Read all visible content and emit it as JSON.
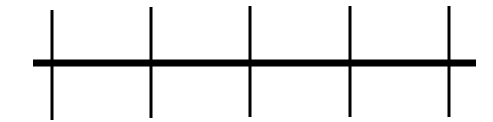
{
  "diagram": {
    "type": "number-line",
    "color": "#000000",
    "background": "#ffffff",
    "axis": {
      "x1": 33,
      "x2": 476,
      "y": 63,
      "thickness": 7
    },
    "ticks": [
      {
        "x": 52,
        "y1": 10,
        "y2": 120
      },
      {
        "x": 151,
        "y1": 7,
        "y2": 118
      },
      {
        "x": 250,
        "y1": 6,
        "y2": 117
      },
      {
        "x": 350,
        "y1": 6,
        "y2": 117
      },
      {
        "x": 449,
        "y1": 6,
        "y2": 117
      }
    ],
    "tick_width": 3,
    "tick_count": 5,
    "labels": []
  }
}
